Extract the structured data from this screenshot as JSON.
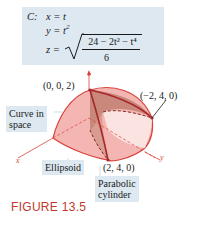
{
  "equation_box": {
    "curve_label": "C:",
    "x_eq": "x = t",
    "y_eq_base": "y = t",
    "y_eq_exp": "2",
    "z_lhs": "z =",
    "z_numerator": "24 − 2t² − t⁴",
    "z_denominator": "6"
  },
  "figure": {
    "point_top": "(0, 0, 2)",
    "point_right": "(−2, 4, 0)",
    "point_bottom": "(2, 4, 0)",
    "axis_x": "x",
    "axis_y": "y",
    "axis_z": "z",
    "callout_curve": [
      "Curve in",
      "space"
    ],
    "callout_ellipsoid": "Ellipsoid",
    "callout_cylinder": [
      "Parabolic",
      "cylinder"
    ],
    "colors": {
      "surface_fill": "#f4a9a6",
      "surface_edge": "#d9413a",
      "cylinder_fill": "#b97a6a",
      "callout_bg": "#dde8f1",
      "title_color": "#c0392b"
    }
  },
  "caption": "FIGURE 13.5"
}
